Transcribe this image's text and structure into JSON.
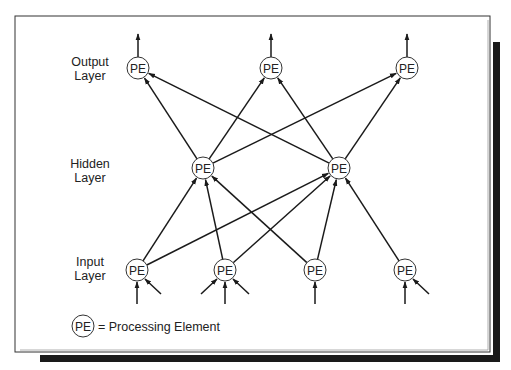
{
  "diagram": {
    "layers": {
      "output": {
        "label_line1": "Output",
        "label_line2": "Layer"
      },
      "hidden": {
        "label_line1": "Hidden",
        "label_line2": "Layer"
      },
      "input": {
        "label_line1": "Input",
        "label_line2": "Layer"
      }
    },
    "node_label": "PE",
    "nodes": [
      {
        "id": "O1",
        "layer": "output",
        "x": 138,
        "y": 68
      },
      {
        "id": "O2",
        "layer": "output",
        "x": 271,
        "y": 68
      },
      {
        "id": "O3",
        "layer": "output",
        "x": 407,
        "y": 68
      },
      {
        "id": "H1",
        "layer": "hidden",
        "x": 203,
        "y": 168
      },
      {
        "id": "H2",
        "layer": "hidden",
        "x": 339,
        "y": 168
      },
      {
        "id": "I1",
        "layer": "input",
        "x": 137,
        "y": 270
      },
      {
        "id": "I2",
        "layer": "input",
        "x": 225,
        "y": 270
      },
      {
        "id": "I3",
        "layer": "input",
        "x": 315,
        "y": 270
      },
      {
        "id": "I4",
        "layer": "input",
        "x": 405,
        "y": 270
      }
    ],
    "edges": [
      [
        "I1",
        "H1"
      ],
      [
        "I1",
        "H2"
      ],
      [
        "I2",
        "H1"
      ],
      [
        "I2",
        "H2"
      ],
      [
        "I3",
        "H1"
      ],
      [
        "I3",
        "H2"
      ],
      [
        "I4",
        "H2"
      ],
      [
        "H1",
        "O1"
      ],
      [
        "H1",
        "O2"
      ],
      [
        "H1",
        "O3"
      ],
      [
        "H2",
        "O1"
      ],
      [
        "H2",
        "O2"
      ],
      [
        "H2",
        "O3"
      ]
    ],
    "legend": {
      "symbol": "PE",
      "text": "= Processing Element"
    },
    "colors": {
      "line": "#1a1a1a",
      "border": "#333333",
      "shadow": "#1a1a1a",
      "background": "#ffffff"
    }
  }
}
